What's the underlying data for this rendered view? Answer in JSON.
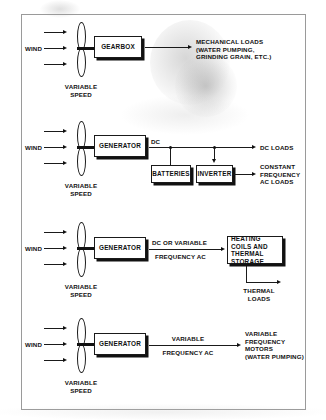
{
  "diagram": {
    "frame_color": "#9a9a9a",
    "ink_color": "#111111",
    "wind_label": "WIND",
    "variable_speed_label": "VARIABLE\nSPEED"
  },
  "sections": [
    {
      "id": "mechanical",
      "wind_label": "WIND",
      "rotor_caption": "VARIABLE\nSPEED",
      "boxes": [
        {
          "name": "gearbox",
          "label": "GEARBOX"
        }
      ],
      "line_labels": [],
      "output_label": "MECHANICAL LOADS\n(WATER PUMPING,\nGRINDING GRAIN, ETC.)"
    },
    {
      "id": "dc-battery-inverter",
      "wind_label": "WIND",
      "rotor_caption": "VARIABLE\nSPEED",
      "boxes": [
        {
          "name": "generator",
          "label": "GENERATOR"
        },
        {
          "name": "batteries",
          "label": "BATTERIES"
        },
        {
          "name": "inverter",
          "label": "INVERTER"
        }
      ],
      "line_labels": [
        "DC"
      ],
      "output_label": "DC LOADS",
      "output_label_2": "CONSTANT\nFREQUENCY\nAC LOADS"
    },
    {
      "id": "thermal",
      "wind_label": "WIND",
      "rotor_caption": "VARIABLE\nSPEED",
      "boxes": [
        {
          "name": "generator",
          "label": "GENERATOR"
        },
        {
          "name": "heating-coils",
          "label": "HEATING COILS\nAND THERMAL\nSTORAGE"
        }
      ],
      "line_labels": [
        "DC OR VARIABLE",
        "FREQUENCY AC"
      ],
      "output_label": "THERMAL\nLOADS"
    },
    {
      "id": "variable-frequency-motors",
      "wind_label": "WIND",
      "rotor_caption": "VARIABLE\nSPEED",
      "boxes": [
        {
          "name": "generator",
          "label": "GENERATOR"
        }
      ],
      "line_labels": [
        "VARIABLE",
        "FREQUENCY AC"
      ],
      "output_label": "VARIABLE\nFREQUENCY\nMOTORS\n(WATER PUMPING)"
    }
  ]
}
